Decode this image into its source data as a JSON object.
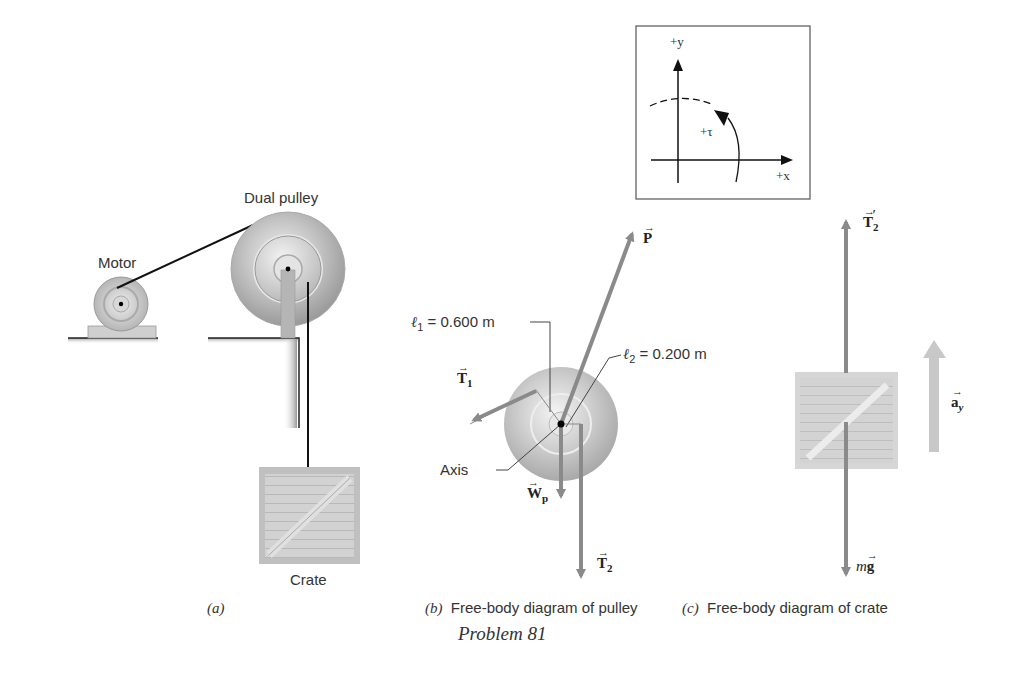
{
  "figure": {
    "problem_label": "Problem 81",
    "panels": [
      {
        "id": "a",
        "caption_letter": "(a)",
        "caption_text": ""
      },
      {
        "id": "b",
        "caption_letter": "(b)",
        "caption_text": "Free-body diagram of pulley"
      },
      {
        "id": "c",
        "caption_letter": "(c)",
        "caption_text": "Free-body diagram of crate"
      }
    ]
  },
  "panel_a": {
    "motor_label": "Motor",
    "pulley_label": "Dual pulley",
    "crate_label": "Crate"
  },
  "axes_inset": {
    "y_label": "+y",
    "x_label": "+x",
    "torque_label": "+τ"
  },
  "panel_b": {
    "l1_label": "ℓ",
    "l1_sub": "1",
    "l1_value": " = 0.600 m",
    "l2_label": "ℓ",
    "l2_sub": "2",
    "l2_value": " = 0.200 m",
    "axis_label": "Axis",
    "vectors": {
      "P": "P",
      "T1": "T",
      "T1_sub": "1",
      "Wp": "W",
      "Wp_sub": "p",
      "T2": "T",
      "T2_sub": "2"
    }
  },
  "panel_c": {
    "vectors": {
      "T2prime": "T",
      "T2prime_sub": "2",
      "T2prime_mark": "′",
      "mg_m": "m",
      "mg_g": "g",
      "ay": "a",
      "ay_sub": "y"
    }
  },
  "colors": {
    "force_arrow": "#8a8a8a",
    "accel_arrow": "#c4c4c4",
    "pulley_metal": "#bdbdbd",
    "crate": "#cfcfcf"
  }
}
